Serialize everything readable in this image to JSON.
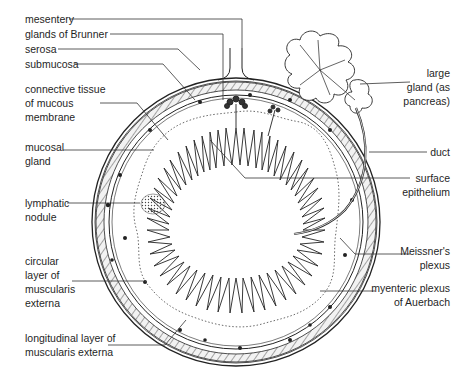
{
  "figure": {
    "labels_left": [
      {
        "id": "mesentery",
        "text": [
          "mesentery"
        ],
        "x": 25,
        "y": 17
      },
      {
        "id": "glands-of-brunner",
        "text": [
          "glands of Brunner"
        ],
        "x": 25,
        "y": 32
      },
      {
        "id": "serosa",
        "text": [
          "serosa"
        ],
        "x": 25,
        "y": 47
      },
      {
        "id": "submucosa",
        "text": [
          "submucosa"
        ],
        "x": 25,
        "y": 62
      },
      {
        "id": "connective-tissue",
        "text": [
          "connective tissue",
          "of mucous",
          "membrane"
        ],
        "x": 25,
        "y": 83
      },
      {
        "id": "mucosal-gland",
        "text": [
          "mucosal",
          "gland"
        ],
        "x": 25,
        "y": 140
      },
      {
        "id": "lymphatic-nodule",
        "text": [
          "lymphatic",
          "nodule"
        ],
        "x": 25,
        "y": 196
      },
      {
        "id": "circular-layer",
        "text": [
          "circular",
          "layer of",
          "muscularis",
          "externa"
        ],
        "x": 25,
        "y": 254
      },
      {
        "id": "longitudinal-layer",
        "text": [
          "longitudinal layer of",
          "muscularis externa"
        ],
        "x": 25,
        "y": 331
      }
    ],
    "labels_right": [
      {
        "id": "large-gland",
        "text": [
          "large",
          "gland (as",
          "pancreas)"
        ],
        "x": 450,
        "y": 66
      },
      {
        "id": "duct",
        "text": [
          "duct"
        ],
        "x": 450,
        "y": 145
      },
      {
        "id": "surface-epithelium",
        "text": [
          "surface",
          "epithelium"
        ],
        "x": 450,
        "y": 171
      },
      {
        "id": "meissners-plexus",
        "text": [
          "Meissner's",
          "plexus"
        ],
        "x": 450,
        "y": 244
      },
      {
        "id": "myenteric-plexus",
        "text": [
          "myenteric plexus",
          "of Auerbach"
        ],
        "x": 450,
        "y": 281
      }
    ]
  }
}
